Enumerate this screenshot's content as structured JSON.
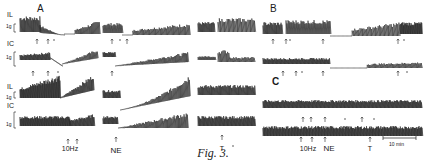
{
  "figure": {
    "caption": "Fig. 3.",
    "panels": [
      {
        "label": "A"
      },
      {
        "label": "B"
      },
      {
        "label": "C"
      }
    ],
    "channel_labels": {
      "trace1": "IL",
      "trace1_scale": "1g",
      "trace2": "IC",
      "trace2_scale": "1g",
      "trace3": "IL",
      "trace3_scale": "1g",
      "trace4": "IC",
      "trace4_scale": "1g"
    },
    "stimulus_labels": {
      "a_10hz": "10Hz",
      "a_ne": "NE",
      "a_t": "T",
      "c_10hz": "10Hz",
      "c_ne": "NE",
      "c_t": "T"
    },
    "scale_bar": {
      "label": "10 min"
    },
    "trace_color": "#222222"
  }
}
